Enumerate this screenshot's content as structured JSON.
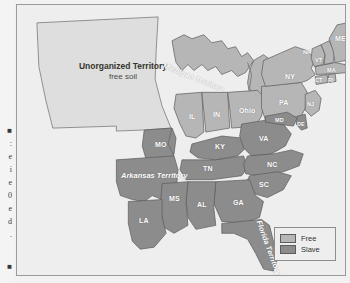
{
  "page": {
    "background_color": "#f2f2f2",
    "frame_border_color": "#9a9a9a"
  },
  "left_gutter": {
    "fragments": [
      "■",
      ":",
      "e",
      "i",
      "e",
      "0",
      "e",
      "d",
      ".",
      "■"
    ]
  },
  "map": {
    "title_block": {
      "title": "Unorganized Territory",
      "subtitle": "free soil"
    },
    "colors": {
      "free": "#b6b6b6",
      "slave": "#8c8c8c",
      "unorganized": "#dedede",
      "water": "#ededed",
      "outline": "#5a5a5a",
      "land_background": "#eeeeee"
    },
    "territories": [
      {
        "name": "Michigan Territory",
        "status": "free"
      },
      {
        "name": "Arkansas Territory",
        "status": "slave"
      },
      {
        "name": "Florida Territory",
        "status": "slave"
      },
      {
        "name": "Unorganized Territory",
        "status": "free"
      }
    ],
    "free_states": [
      {
        "abbr": "IL",
        "name": "Illinois"
      },
      {
        "abbr": "IN",
        "name": "Indiana"
      },
      {
        "abbr": "Ohio",
        "name": "Ohio"
      },
      {
        "abbr": "PA",
        "name": "Pennsylvania"
      },
      {
        "abbr": "NY",
        "name": "New York"
      },
      {
        "abbr": "NJ",
        "name": "New Jersey"
      },
      {
        "abbr": "CT",
        "name": "Connecticut"
      },
      {
        "abbr": "RI",
        "name": "Rhode Island"
      },
      {
        "abbr": "MA",
        "name": "Massachusetts"
      },
      {
        "abbr": "VT",
        "name": "Vermont"
      },
      {
        "abbr": "NH",
        "name": "New Hampshire"
      },
      {
        "abbr": "ME",
        "name": "Maine"
      }
    ],
    "slave_states": [
      {
        "abbr": "MO",
        "name": "Missouri"
      },
      {
        "abbr": "KY",
        "name": "Kentucky"
      },
      {
        "abbr": "TN",
        "name": "Tennessee"
      },
      {
        "abbr": "VA",
        "name": "Virginia"
      },
      {
        "abbr": "NC",
        "name": "North Carolina"
      },
      {
        "abbr": "SC",
        "name": "South Carolina"
      },
      {
        "abbr": "GA",
        "name": "Georgia"
      },
      {
        "abbr": "AL",
        "name": "Alabama"
      },
      {
        "abbr": "MS",
        "name": "Mississippi"
      },
      {
        "abbr": "LA",
        "name": "Louisiana"
      },
      {
        "abbr": "MD",
        "name": "Maryland"
      },
      {
        "abbr": "DE",
        "name": "Delaware"
      }
    ],
    "labels": {
      "michigan_territory": "Michigan Territory",
      "arkansas_territory": "Arkansas Territory",
      "florida_territory": "Florida Territory",
      "il": "IL",
      "in": "IN",
      "oh": "Ohio",
      "pa": "PA",
      "ny": "NY",
      "nj": "NJ",
      "ct": "CT",
      "ri": "RI",
      "ma": "MA",
      "vt": "VT",
      "nh": "NH",
      "me": "ME",
      "mo": "MO",
      "ky": "KY",
      "tn": "TN",
      "va": "VA",
      "nc": "NC",
      "sc": "SC",
      "ga": "GA",
      "al": "AL",
      "ms": "MS",
      "la": "LA",
      "md": "MD",
      "de": "DE"
    }
  },
  "legend": {
    "items": [
      {
        "label": "Free",
        "color": "#b6b6b6"
      },
      {
        "label": "Slave",
        "color": "#8c8c8c"
      }
    ]
  }
}
